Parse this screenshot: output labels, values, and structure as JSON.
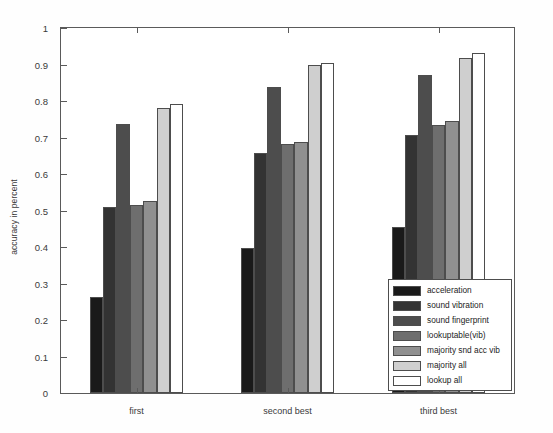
{
  "chart_data": {
    "type": "bar",
    "title": "",
    "xlabel": "",
    "ylabel": "accuracy in percent",
    "ylim": [
      0,
      1
    ],
    "grid": false,
    "legend_position": "lower right",
    "categories": [
      "first",
      "second best",
      "third best"
    ],
    "ytick_labels": [
      "0",
      "0.1",
      "0.2",
      "0.3",
      "0.4",
      "0.5",
      "0.6",
      "0.7",
      "0.8",
      "0.9",
      "1"
    ],
    "ytick_values": [
      0,
      0.1,
      0.2,
      0.3,
      0.4,
      0.5,
      0.6,
      0.7,
      0.8,
      0.9,
      1
    ],
    "series": [
      {
        "name": "acceleration",
        "color": "#1a1a1a",
        "values": [
          0.262,
          0.396,
          0.455
        ]
      },
      {
        "name": "sound vibration",
        "color": "#333333",
        "values": [
          0.51,
          0.658,
          0.708
        ]
      },
      {
        "name": "sound fingerprint",
        "color": "#4d4d4d",
        "values": [
          0.736,
          0.838,
          0.87
        ]
      },
      {
        "name": "lookuptable(vib)",
        "color": "#6e6e6e",
        "values": [
          0.516,
          0.682,
          0.733
        ]
      },
      {
        "name": "majority snd acc vib",
        "color": "#909090",
        "values": [
          0.525,
          0.688,
          0.746
        ]
      },
      {
        "name": "majority all",
        "color": "#cfcfcf",
        "values": [
          0.782,
          0.898,
          0.919
        ]
      },
      {
        "name": "lookup all",
        "color": "#ffffff",
        "values": [
          0.791,
          0.905,
          0.932
        ]
      }
    ]
  },
  "legend": {
    "items": [
      {
        "label": "acceleration"
      },
      {
        "label": "sound vibration"
      },
      {
        "label": "sound fingerprint"
      },
      {
        "label": "lookuptable(vib)"
      },
      {
        "label": "majority snd acc vib"
      },
      {
        "label": "majority all"
      },
      {
        "label": "lookup all"
      }
    ]
  }
}
